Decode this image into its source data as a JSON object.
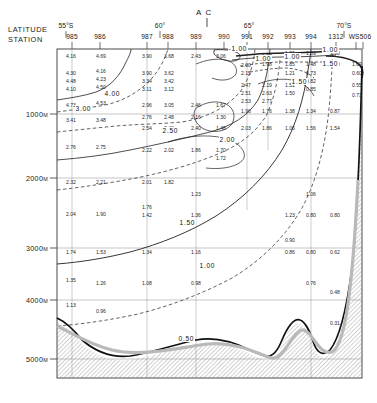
{
  "axes": {
    "latitude_label": "LATITUDE",
    "station_label": "STATION",
    "convergence_marker": "A C",
    "latitudes": [
      {
        "text": "55°S",
        "x": 66
      },
      {
        "text": "60°",
        "x": 160
      },
      {
        "text": "65°",
        "x": 249
      },
      {
        "text": "70°S",
        "x": 344
      }
    ],
    "stations": [
      {
        "id": "985",
        "x": 72
      },
      {
        "id": "986",
        "x": 100
      },
      {
        "id": "987",
        "x": 147
      },
      {
        "id": "988",
        "x": 168
      },
      {
        "id": "989",
        "x": 196
      },
      {
        "id": "990",
        "x": 224
      },
      {
        "id": "991",
        "x": 247
      },
      {
        "id": "992",
        "x": 268
      },
      {
        "id": "993",
        "x": 290
      },
      {
        "id": "994",
        "x": 311
      },
      {
        "id": "1312",
        "x": 336
      },
      {
        "id": "WS506",
        "x": 360
      }
    ],
    "depths": [
      {
        "text": "1000",
        "unit": "M",
        "y": 114
      },
      {
        "text": "2000",
        "unit": "M",
        "y": 178
      },
      {
        "text": "3000",
        "unit": "M",
        "y": 248
      },
      {
        "text": "4000",
        "unit": "M",
        "y": 300
      },
      {
        "text": "5000",
        "unit": "M",
        "y": 359
      }
    ]
  },
  "chart_data": {
    "type": "line",
    "title": "",
    "subtitle": "",
    "xlabel": "LATITUDE / STATION",
    "ylabel": "DEPTH (M)",
    "xlim": [
      55,
      70
    ],
    "ylim": [
      0,
      5500
    ],
    "grid": true,
    "legend_position": "none",
    "variable": "potential temperature (°C)",
    "contour_levels": [
      -1.0,
      0.5,
      1.0,
      1.5,
      2.0,
      2.5,
      4.0
    ],
    "contour_labels": [
      {
        "text": "4.00",
        "x": 104,
        "y": 90
      },
      {
        "text": "3.00",
        "x": 75,
        "y": 105
      },
      {
        "text": "2.50",
        "x": 162,
        "y": 127
      },
      {
        "text": "2.00",
        "x": 219,
        "y": 136
      },
      {
        "text": "1.50",
        "x": 179,
        "y": 219
      },
      {
        "text": "1.00",
        "x": 199,
        "y": 262
      },
      {
        "text": "0.50",
        "x": 178,
        "y": 335
      },
      {
        "text": "-1.00",
        "x": 228,
        "y": 45
      },
      {
        "text": "1.00",
        "x": 322,
        "y": 46
      },
      {
        "text": "1.00",
        "x": 284,
        "y": 53
      },
      {
        "text": "1.50",
        "x": 322,
        "y": 60
      },
      {
        "text": "1.50",
        "x": 291,
        "y": 78
      },
      {
        "text": "1.00",
        "x": 255,
        "y": 55
      }
    ],
    "stations_data": [
      {
        "station": "985",
        "x": 72,
        "values": [
          {
            "v": "4.16",
            "y": 53
          },
          {
            "v": "4.30",
            "y": 70
          },
          {
            "v": "4.48",
            "y": 78
          },
          {
            "v": "4.10",
            "y": 86
          },
          {
            "v": "4.73",
            "y": 102
          },
          {
            "v": "3.41",
            "y": 117
          },
          {
            "v": "2.76",
            "y": 144
          },
          {
            "v": "2.32",
            "y": 179
          },
          {
            "v": "2.04",
            "y": 211
          },
          {
            "v": "1.74",
            "y": 249
          },
          {
            "v": "1.35",
            "y": 277
          },
          {
            "v": "1.13",
            "y": 302
          }
        ]
      },
      {
        "station": "986",
        "x": 102,
        "values": [
          {
            "v": "4.69",
            "y": 53
          },
          {
            "v": "4.16",
            "y": 68
          },
          {
            "v": "4.23",
            "y": 76
          },
          {
            "v": "4.50",
            "y": 84
          },
          {
            "v": "4.53",
            "y": 100
          },
          {
            "v": "3.48",
            "y": 117
          },
          {
            "v": "2.75",
            "y": 144
          },
          {
            "v": "2.21",
            "y": 179
          },
          {
            "v": "1.90",
            "y": 211
          },
          {
            "v": "1.53",
            "y": 249
          },
          {
            "v": "1.26",
            "y": 280
          },
          {
            "v": "0.96",
            "y": 308
          }
        ]
      },
      {
        "station": "987",
        "x": 148,
        "values": [
          {
            "v": "3.90",
            "y": 53
          },
          {
            "v": "3.90",
            "y": 70
          },
          {
            "v": "3.34",
            "y": 78
          },
          {
            "v": "3.11",
            "y": 86
          },
          {
            "v": "2.96",
            "y": 102
          },
          {
            "v": "2.76",
            "y": 114
          },
          {
            "v": "2.54",
            "y": 125
          },
          {
            "v": "2.22",
            "y": 147
          },
          {
            "v": "2.01",
            "y": 179
          },
          {
            "v": "1.76",
            "y": 204
          },
          {
            "v": "1.42",
            "y": 212
          },
          {
            "v": "1.34",
            "y": 249
          },
          {
            "v": "1.08",
            "y": 280
          }
        ]
      },
      {
        "station": "988",
        "x": 170,
        "values": [
          {
            "v": "3.68",
            "y": 53
          },
          {
            "v": "3.62",
            "y": 70
          },
          {
            "v": "3.42",
            "y": 78
          },
          {
            "v": "3.12",
            "y": 86
          },
          {
            "v": "3.05",
            "y": 102
          },
          {
            "v": "2.48",
            "y": 114
          },
          {
            "v": "2.43",
            "y": 125
          },
          {
            "v": "2.02",
            "y": 147
          },
          {
            "v": "1.82",
            "y": 179
          }
        ]
      },
      {
        "station": "989",
        "x": 197,
        "values": [
          {
            "v": "2.43",
            "y": 53
          },
          {
            "v": "2.46",
            "y": 102
          },
          {
            "v": "2.16",
            "y": 114
          },
          {
            "v": "2.40",
            "y": 125
          },
          {
            "v": "1.86",
            "y": 147
          },
          {
            "v": "1.23",
            "y": 191
          },
          {
            "v": "1.36",
            "y": 212
          },
          {
            "v": "1.16",
            "y": 249
          },
          {
            "v": "0.98",
            "y": 280
          }
        ]
      },
      {
        "station": "990",
        "x": 222,
        "values": [
          {
            "v": "3.06",
            "y": 53
          },
          {
            "v": "1.67",
            "y": 102
          },
          {
            "v": "1.30",
            "y": 114
          },
          {
            "v": "1.48",
            "y": 125
          },
          {
            "v": "1.70",
            "y": 147
          },
          {
            "v": "1.72",
            "y": 155
          }
        ]
      },
      {
        "station": "991",
        "x": 247,
        "values": [
          {
            "v": "2.00",
            "y": 62
          },
          {
            "v": "2.15",
            "y": 70
          },
          {
            "v": "2.47",
            "y": 82
          },
          {
            "v": "2.51",
            "y": 90
          },
          {
            "v": "2.53",
            "y": 98
          },
          {
            "v": "1.96",
            "y": 108
          },
          {
            "v": "2.03",
            "y": 125
          }
        ]
      },
      {
        "station": "992",
        "x": 268,
        "values": [
          {
            "v": "1.52",
            "y": 53
          },
          {
            "v": "1.98",
            "y": 61
          },
          {
            "v": "2.19",
            "y": 82
          },
          {
            "v": "2.63",
            "y": 90
          },
          {
            "v": "2.77",
            "y": 98
          },
          {
            "v": "1.76",
            "y": 108
          },
          {
            "v": "1.86",
            "y": 125
          }
        ]
      },
      {
        "station": "993",
        "x": 291,
        "values": [
          {
            "v": "1.86",
            "y": 50
          },
          {
            "v": "1.85",
            "y": 61
          },
          {
            "v": "1.21",
            "y": 70
          },
          {
            "v": "1.51",
            "y": 82
          },
          {
            "v": "1.50",
            "y": 90
          },
          {
            "v": "1.38",
            "y": 108
          },
          {
            "v": "1.06",
            "y": 125
          },
          {
            "v": "1.23",
            "y": 212
          },
          {
            "v": "0.90",
            "y": 237
          },
          {
            "v": "0.86",
            "y": 249
          }
        ]
      },
      {
        "station": "994",
        "x": 312,
        "values": [
          {
            "v": "1.69",
            "y": 50
          },
          {
            "v": "1.48",
            "y": 61
          },
          {
            "v": "0.73",
            "y": 70
          },
          {
            "v": "0.82",
            "y": 78
          },
          {
            "v": "0.85",
            "y": 86
          },
          {
            "v": "1.34",
            "y": 108
          },
          {
            "v": "1.56",
            "y": 125
          },
          {
            "v": "1.06",
            "y": 191
          },
          {
            "v": "0.80",
            "y": 212
          },
          {
            "v": "0.80",
            "y": 249
          },
          {
            "v": "0.76",
            "y": 280
          }
        ]
      },
      {
        "station": "1312",
        "x": 336,
        "values": [
          {
            "v": "1.00",
            "y": 50
          },
          {
            "v": "1.50",
            "y": 61
          },
          {
            "v": "0.87",
            "y": 108
          },
          {
            "v": "1.54",
            "y": 125
          },
          {
            "v": "0.80",
            "y": 212
          },
          {
            "v": "0.62",
            "y": 249
          },
          {
            "v": "0.48",
            "y": 289
          },
          {
            "v": "0.31",
            "y": 320
          }
        ]
      },
      {
        "station": "WS506",
        "x": 358,
        "values": [
          {
            "v": "1.09",
            "y": 61
          },
          {
            "v": "0.60",
            "y": 70
          },
          {
            "v": "0.55",
            "y": 82
          },
          {
            "v": "0.73",
            "y": 92
          }
        ]
      }
    ],
    "bathymetry_note": "hatched seafloor with seamount near 65S and steep Antarctic continental slope at right"
  }
}
